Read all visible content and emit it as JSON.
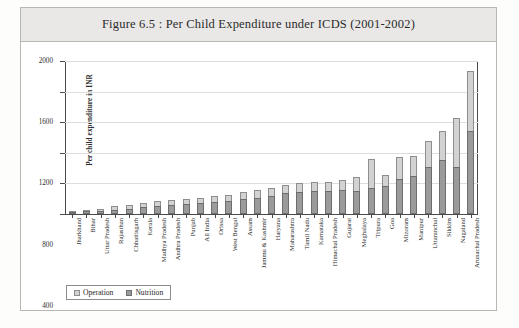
{
  "figure": {
    "title": "Figure 6.5 : Per Child Expenditure under ICDS (2001-2002)"
  },
  "legend": {
    "items": [
      {
        "label": "Operation",
        "color": "#d2d2d2",
        "icon": "legend-swatch"
      },
      {
        "label": "Nutrition",
        "color": "#9b9b9b",
        "icon": "legend-swatch"
      }
    ]
  },
  "chart_data": {
    "type": "bar",
    "stacked": true,
    "title": "Figure 6.5 : Per Child Expenditure under ICDS (2001-2002)",
    "xlabel": "",
    "ylabel": "Per child expenditure in INR",
    "ylim": [
      0,
      2000
    ],
    "yticks": [
      0,
      400,
      800,
      1200,
      1600,
      2000
    ],
    "ytick_labels": [
      "0",
      "400",
      "800",
      "1200",
      "1600",
      "2000"
    ],
    "grid": "horizontal",
    "legend_position": "bottom-left",
    "categories": [
      "Jharkhand",
      "Bihar",
      "Uttar Pradesh",
      "Rajasthan",
      "Chhattisgarh",
      "Kerala",
      "Madhya Pradesh",
      "Andhra Pradesh",
      "Punjab",
      "All India",
      "Orissa",
      "West Bengal",
      "Assam",
      "Jammu & Kashmir",
      "Haryana",
      "Maharashtra",
      "Tamil Nadu",
      "Karnataka",
      "Himachal Pradesh",
      "Gujarat",
      "Meghalaya",
      "Tripura",
      "Goa",
      "Mizoram",
      "Manipur",
      "Uttaranchal",
      "Sikkim",
      "Nagaland",
      "Arunachal Pradesh"
    ],
    "series": [
      {
        "name": "Nutrition",
        "color": "#9b9b9b",
        "values": [
          15,
          35,
          40,
          55,
          70,
          95,
          105,
          120,
          130,
          145,
          160,
          175,
          200,
          215,
          235,
          270,
          285,
          300,
          300,
          320,
          300,
          340,
          360,
          460,
          500,
          620,
          700,
          620,
          1090
        ]
      },
      {
        "name": "Operation",
        "color": "#d2d2d2",
        "values": [
          10,
          20,
          25,
          45,
          45,
          55,
          60,
          60,
          65,
          70,
          75,
          80,
          85,
          95,
          100,
          105,
          115,
          120,
          125,
          130,
          180,
          380,
          145,
          290,
          260,
          340,
          380,
          640,
          780
        ]
      }
    ],
    "totals": [
      25,
      55,
      65,
      100,
      115,
      150,
      165,
      180,
      195,
      215,
      235,
      255,
      285,
      310,
      335,
      375,
      400,
      420,
      425,
      450,
      480,
      720,
      505,
      750,
      760,
      960,
      1080,
      1260,
      1870
    ]
  }
}
